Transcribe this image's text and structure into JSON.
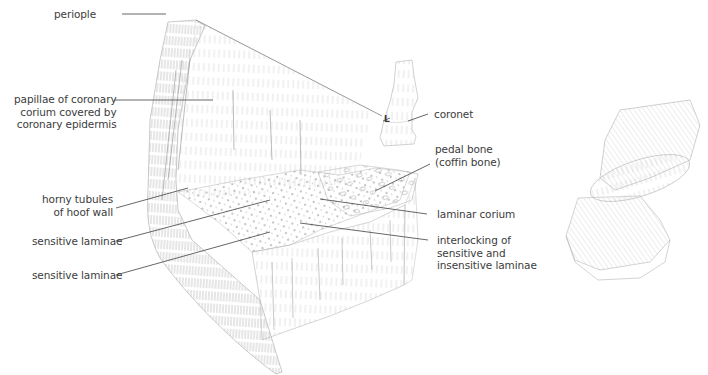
{
  "diagram": {
    "labels": {
      "periople": "periople",
      "papillae": "papillae of coronary\ncorium covered by\ncoronary epidermis",
      "horny_tubules": "horny tubules\nof hoof wall",
      "sensitive_laminae_1": "sensitive laminae",
      "sensitive_laminae_2": "sensitive laminae",
      "coronet": "coronet",
      "pedal_bone": "pedal bone\n(coffin bone)",
      "laminar_corium": "laminar corium",
      "interlocking": "interlocking of\nsensitive and\ninsensitive laminae"
    },
    "inset_marker": "L",
    "colors": {
      "ink": "#3c3c3c",
      "leader": "#555555",
      "sketch": "#8a8a8a",
      "sketch_light": "#c4c4c4"
    }
  }
}
